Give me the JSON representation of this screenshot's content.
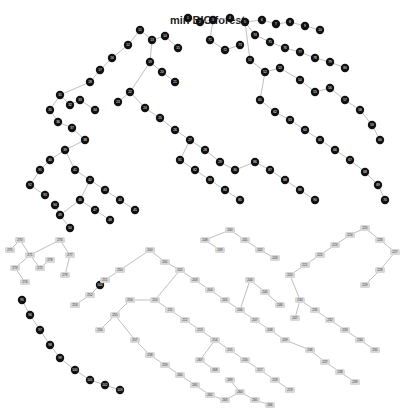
{
  "title": "min BIC forest",
  "colors": {
    "dark_node": "#111111",
    "light_node": "#d8d8d8",
    "edge": "#b8b8b8"
  },
  "dark_nodes": [
    [
      188,
      18
    ],
    [
      200,
      22
    ],
    [
      213,
      20
    ],
    [
      230,
      18
    ],
    [
      245,
      22
    ],
    [
      262,
      20
    ],
    [
      276,
      24
    ],
    [
      290,
      22
    ],
    [
      305,
      26
    ],
    [
      320,
      30
    ],
    [
      140,
      30
    ],
    [
      128,
      45
    ],
    [
      152,
      40
    ],
    [
      165,
      36
    ],
    [
      178,
      48
    ],
    [
      112,
      58
    ],
    [
      100,
      70
    ],
    [
      90,
      82
    ],
    [
      150,
      62
    ],
    [
      162,
      72
    ],
    [
      175,
      82
    ],
    [
      130,
      92
    ],
    [
      118,
      102
    ],
    [
      145,
      108
    ],
    [
      160,
      118
    ],
    [
      175,
      130
    ],
    [
      190,
      140
    ],
    [
      205,
      150
    ],
    [
      220,
      162
    ],
    [
      235,
      170
    ],
    [
      60,
      95
    ],
    [
      70,
      105
    ],
    [
      80,
      100
    ],
    [
      95,
      110
    ],
    [
      50,
      110
    ],
    [
      58,
      122
    ],
    [
      72,
      128
    ],
    [
      85,
      140
    ],
    [
      65,
      150
    ],
    [
      50,
      160
    ],
    [
      75,
      170
    ],
    [
      90,
      180
    ],
    [
      105,
      190
    ],
    [
      120,
      200
    ],
    [
      135,
      210
    ],
    [
      80,
      200
    ],
    [
      95,
      210
    ],
    [
      110,
      220
    ],
    [
      60,
      215
    ],
    [
      70,
      228
    ],
    [
      250,
      60
    ],
    [
      265,
      72
    ],
    [
      280,
      68
    ],
    [
      300,
      80
    ],
    [
      315,
      92
    ],
    [
      330,
      88
    ],
    [
      345,
      100
    ],
    [
      360,
      110
    ],
    [
      372,
      125
    ],
    [
      380,
      140
    ],
    [
      260,
      100
    ],
    [
      275,
      112
    ],
    [
      290,
      120
    ],
    [
      305,
      130
    ],
    [
      320,
      140
    ],
    [
      335,
      150
    ],
    [
      350,
      160
    ],
    [
      365,
      172
    ],
    [
      378,
      185
    ],
    [
      385,
      200
    ],
    [
      210,
      40
    ],
    [
      225,
      50
    ],
    [
      240,
      45
    ],
    [
      255,
      35
    ],
    [
      270,
      42
    ],
    [
      285,
      48
    ],
    [
      300,
      52
    ],
    [
      315,
      58
    ],
    [
      330,
      62
    ],
    [
      345,
      68
    ],
    [
      180,
      160
    ],
    [
      195,
      170
    ],
    [
      210,
      180
    ],
    [
      225,
      190
    ],
    [
      240,
      200
    ],
    [
      255,
      162
    ],
    [
      270,
      170
    ],
    [
      285,
      180
    ],
    [
      300,
      190
    ],
    [
      315,
      200
    ],
    [
      40,
      170
    ],
    [
      30,
      185
    ],
    [
      45,
      195
    ],
    [
      55,
      205
    ],
    [
      22,
      300
    ],
    [
      30,
      315
    ],
    [
      40,
      330
    ],
    [
      50,
      345
    ],
    [
      60,
      358
    ],
    [
      75,
      370
    ],
    [
      90,
      380
    ],
    [
      105,
      385
    ],
    [
      120,
      390
    ],
    [
      100,
      285
    ]
  ],
  "light_nodes": [
    [
      150,
      250
    ],
    [
      165,
      262
    ],
    [
      180,
      270
    ],
    [
      195,
      280
    ],
    [
      210,
      290
    ],
    [
      225,
      300
    ],
    [
      240,
      310
    ],
    [
      255,
      320
    ],
    [
      270,
      330
    ],
    [
      285,
      340
    ],
    [
      155,
      300
    ],
    [
      170,
      310
    ],
    [
      185,
      320
    ],
    [
      200,
      330
    ],
    [
      215,
      340
    ],
    [
      230,
      350
    ],
    [
      245,
      360
    ],
    [
      260,
      370
    ],
    [
      275,
      380
    ],
    [
      290,
      390
    ],
    [
      290,
      275
    ],
    [
      305,
      265
    ],
    [
      320,
      255
    ],
    [
      335,
      245
    ],
    [
      350,
      235
    ],
    [
      365,
      228
    ],
    [
      380,
      240
    ],
    [
      395,
      252
    ],
    [
      380,
      270
    ],
    [
      365,
      285
    ],
    [
      300,
      300
    ],
    [
      315,
      310
    ],
    [
      330,
      320
    ],
    [
      345,
      330
    ],
    [
      360,
      340
    ],
    [
      375,
      350
    ],
    [
      310,
      350
    ],
    [
      325,
      362
    ],
    [
      340,
      372
    ],
    [
      355,
      382
    ],
    [
      230,
      230
    ],
    [
      245,
      240
    ],
    [
      260,
      250
    ],
    [
      275,
      258
    ],
    [
      250,
      280
    ],
    [
      265,
      292
    ],
    [
      280,
      305
    ],
    [
      295,
      318
    ],
    [
      205,
      240
    ],
    [
      220,
      250
    ],
    [
      120,
      270
    ],
    [
      105,
      280
    ],
    [
      90,
      295
    ],
    [
      75,
      305
    ],
    [
      130,
      300
    ],
    [
      115,
      315
    ],
    [
      100,
      330
    ],
    [
      135,
      340
    ],
    [
      150,
      355
    ],
    [
      165,
      365
    ],
    [
      180,
      375
    ],
    [
      195,
      385
    ],
    [
      210,
      395
    ],
    [
      225,
      400
    ],
    [
      240,
      392
    ],
    [
      255,
      400
    ],
    [
      270,
      405
    ],
    [
      200,
      360
    ],
    [
      215,
      370
    ],
    [
      230,
      380
    ],
    [
      20,
      240
    ],
    [
      30,
      255
    ],
    [
      40,
      268
    ],
    [
      15,
      268
    ],
    [
      25,
      282
    ],
    [
      10,
      250
    ],
    [
      60,
      240
    ],
    [
      70,
      255
    ],
    [
      50,
      260
    ],
    [
      65,
      275
    ]
  ],
  "edges_count_note": "tree edges connecting nodes"
}
